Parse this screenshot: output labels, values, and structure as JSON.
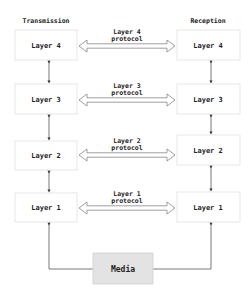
{
  "headers": {
    "left": "Transmission",
    "right": "Reception"
  },
  "transmission_layers": [
    "Layer 4",
    "Layer 3",
    "Layer 2",
    "Layer 1"
  ],
  "reception_layers": [
    "Layer 4",
    "Layer 3",
    "Layer 2",
    "Layer 1"
  ],
  "protocols": [
    {
      "line1": "Layer 4",
      "line2": "protocol"
    },
    {
      "line1": "Layer 3",
      "line2": "protocol"
    },
    {
      "line1": "Layer 2",
      "line2": "protocol"
    },
    {
      "line1": "Layer 1",
      "line2": "protocol"
    }
  ],
  "media": {
    "label": "Media",
    "fill": "#e3e3e3"
  },
  "colors": {
    "box_border": "#e0e0e0",
    "line": "#555555",
    "text": "#222222"
  }
}
